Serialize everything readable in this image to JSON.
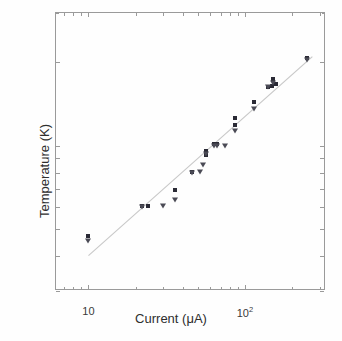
{
  "figure": {
    "background": "#fefefe",
    "frame_color": "#9a9a9a"
  },
  "axis_titles": {
    "x": "Current (μA)",
    "y": "Temperature (K)"
  },
  "y_ticks": [
    {
      "value": 3,
      "label": "3"
    },
    {
      "value": 4,
      "label": "4"
    },
    {
      "value": 5,
      "label": "5"
    },
    {
      "value": 6,
      "label": "6"
    },
    {
      "value": 7,
      "label": "7"
    },
    {
      "value": 8,
      "label": "8"
    },
    {
      "value": 9,
      "label": "9"
    },
    {
      "value": 10,
      "label": "10"
    },
    {
      "value": 20,
      "label": "20"
    }
  ],
  "y_minor_ticks": [
    30
  ],
  "x_ticks": [
    {
      "value": 10,
      "label": "10",
      "html": "10"
    },
    {
      "value": 100,
      "label": "10^2",
      "html": "10<sup>2</sup>"
    }
  ],
  "x_minor_ticks": [
    6,
    7,
    8,
    9,
    20,
    30,
    40,
    50,
    60,
    70,
    80,
    90,
    200,
    300
  ],
  "chart_data": {
    "type": "scatter",
    "title": "",
    "xlabel": "Current (μA)",
    "ylabel": "Temperature (K)",
    "xscale": "log",
    "yscale": "log",
    "xlim": [
      6.2,
      330
    ],
    "ylim": [
      3,
      30
    ],
    "grid": false,
    "legend": null,
    "marker_colors": {
      "square": "#2a2a35",
      "triangle": "#4a4a55"
    },
    "series": [
      {
        "name": "square",
        "marker": "square",
        "points": [
          {
            "x": 10,
            "y": 4.72
          },
          {
            "x": 22,
            "y": 6.05
          },
          {
            "x": 24,
            "y": 6.05
          },
          {
            "x": 36,
            "y": 6.95
          },
          {
            "x": 46,
            "y": 8.05
          },
          {
            "x": 56,
            "y": 9.55
          },
          {
            "x": 56,
            "y": 9.25
          },
          {
            "x": 63,
            "y": 10.1
          },
          {
            "x": 66,
            "y": 10.1
          },
          {
            "x": 86,
            "y": 12.6
          },
          {
            "x": 86,
            "y": 11.9
          },
          {
            "x": 115,
            "y": 14.3
          },
          {
            "x": 140,
            "y": 16.3
          },
          {
            "x": 148,
            "y": 16.4
          },
          {
            "x": 152,
            "y": 17.3
          },
          {
            "x": 158,
            "y": 16.6
          },
          {
            "x": 250,
            "y": 20.6
          }
        ]
      },
      {
        "name": "triangle",
        "marker": "triangle",
        "points": [
          {
            "x": 10,
            "y": 4.55
          },
          {
            "x": 22,
            "y": 6.0
          },
          {
            "x": 30,
            "y": 6.05
          },
          {
            "x": 36,
            "y": 6.35
          },
          {
            "x": 46,
            "y": 8.0
          },
          {
            "x": 52,
            "y": 8.05
          },
          {
            "x": 54,
            "y": 8.55
          },
          {
            "x": 56,
            "y": 9.35
          },
          {
            "x": 63,
            "y": 10.0
          },
          {
            "x": 66,
            "y": 10.0
          },
          {
            "x": 75,
            "y": 10.0
          },
          {
            "x": 86,
            "y": 11.3
          },
          {
            "x": 115,
            "y": 13.6
          },
          {
            "x": 140,
            "y": 16.2
          },
          {
            "x": 152,
            "y": 16.8
          },
          {
            "x": 250,
            "y": 20.4
          }
        ]
      }
    ],
    "fit_line": {
      "name": "power-law-fit",
      "color": "#c8c8c8",
      "endpoints": [
        {
          "x": 10,
          "y": 4.02
        },
        {
          "x": 270,
          "y": 20.9
        }
      ]
    }
  }
}
